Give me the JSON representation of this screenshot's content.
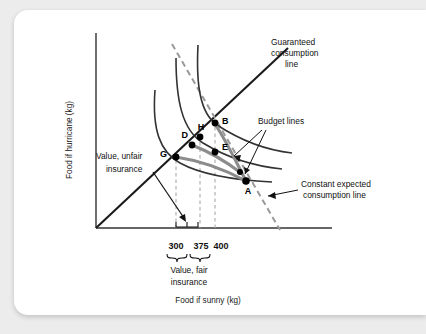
{
  "figure": {
    "background_color": "#ffffff",
    "page_background_color": "#ececec",
    "axes": {
      "y_label": "Food if hurricane (kg)",
      "x_label": "Food if sunny (kg)",
      "axis_color": "#333333"
    },
    "tick_labels": [
      {
        "id": "tick-300",
        "text": "300",
        "x_value": 300
      },
      {
        "id": "tick-375",
        "text": "375",
        "x_value": 375
      },
      {
        "id": "tick-400",
        "text": "400",
        "x_value": 400
      }
    ],
    "annotations": [
      {
        "id": "guaranteed-consumption-line",
        "line1": "Guaranteed",
        "line2": "consumption",
        "line3": "line"
      },
      {
        "id": "budget-lines",
        "line1": "Budget lines"
      },
      {
        "id": "constant-expected-consumption-line",
        "line1": "Constant expected",
        "line2": "consumption line"
      },
      {
        "id": "value-unfair-insurance",
        "line1": "Value, unfair",
        "line2": "insurance"
      },
      {
        "id": "value-fair-insurance",
        "line1": "Value, fair",
        "line2": "insurance"
      }
    ],
    "points": [
      {
        "label": "G",
        "x": 176,
        "y": 157
      },
      {
        "label": "D",
        "x": 192,
        "y": 145
      },
      {
        "label": "H",
        "x": 200,
        "y": 137
      },
      {
        "label": "B",
        "x": 215,
        "y": 123
      },
      {
        "label": "E",
        "x": 215,
        "y": 152
      },
      {
        "label": "A",
        "x": 245,
        "y": 181
      },
      {
        "label": "",
        "x": 240,
        "y": 172
      }
    ],
    "curves": [
      {
        "id": "indifference-curve-low",
        "color": "#333333"
      },
      {
        "id": "indifference-curve-mid",
        "color": "#333333"
      },
      {
        "id": "indifference-curve-high",
        "color": "#333333"
      },
      {
        "id": "budget-line-fair",
        "color": "#808080"
      },
      {
        "id": "budget-line-unfair",
        "color": "#808080"
      },
      {
        "id": "guaranteed-consumption-45-line",
        "color": "#1a1a1a"
      },
      {
        "id": "constant-expected-consumption-dashed",
        "color": "#999999"
      }
    ]
  }
}
